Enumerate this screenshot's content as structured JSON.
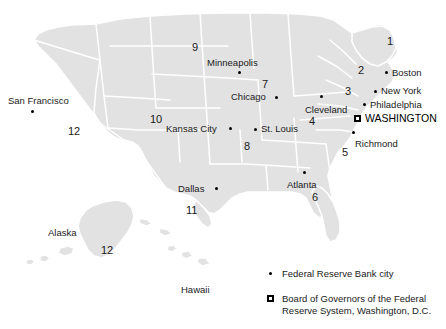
{
  "map": {
    "title": "Federal Reserve Districts Map",
    "land_color": "#e2e2e2",
    "border_color": "#ffffff",
    "background_color": "#ffffff",
    "marker_color": "#000000"
  },
  "cities": [
    {
      "name": "San Francisco",
      "label_x": 8,
      "label_y": 96,
      "dot_x": 31,
      "dot_y": 110
    },
    {
      "name": "Minneapolis",
      "label_x": 207,
      "label_y": 58,
      "dot_x": 238,
      "dot_y": 71
    },
    {
      "name": "Chicago",
      "label_x": 231,
      "label_y": 92,
      "dot_x": 275,
      "dot_y": 96
    },
    {
      "name": "Kansas City",
      "label_x": 166,
      "label_y": 124,
      "dot_x": 229,
      "dot_y": 127
    },
    {
      "name": "St. Louis",
      "label_x": 261,
      "label_y": 124,
      "dot_x": 255,
      "dot_y": 128
    },
    {
      "name": "Cleveland",
      "label_x": 305,
      "label_y": 105,
      "dot_x": 320,
      "dot_y": 95
    },
    {
      "name": "Boston",
      "label_x": 392,
      "label_y": 68,
      "dot_x": 385,
      "dot_y": 71
    },
    {
      "name": "New York",
      "label_x": 381,
      "label_y": 86,
      "dot_x": 374,
      "dot_y": 90
    },
    {
      "name": "Philadelphia",
      "label_x": 370,
      "label_y": 100,
      "dot_x": 363,
      "dot_y": 103
    },
    {
      "name": "Richmond",
      "label_x": 355,
      "label_y": 139,
      "dot_x": 352,
      "dot_y": 131
    },
    {
      "name": "Atlanta",
      "label_x": 287,
      "label_y": 180,
      "dot_x": 303,
      "dot_y": 171
    },
    {
      "name": "Dallas",
      "label_x": 178,
      "label_y": 184,
      "dot_x": 215,
      "dot_y": 187
    }
  ],
  "districts": [
    {
      "number": "1",
      "x": 387,
      "y": 36
    },
    {
      "number": "2",
      "x": 358,
      "y": 65
    },
    {
      "number": "3",
      "x": 345,
      "y": 86
    },
    {
      "number": "4",
      "x": 309,
      "y": 116
    },
    {
      "number": "5",
      "x": 342,
      "y": 147
    },
    {
      "number": "6",
      "x": 312,
      "y": 192
    },
    {
      "number": "7",
      "x": 262,
      "y": 79
    },
    {
      "number": "8",
      "x": 244,
      "y": 141
    },
    {
      "number": "9",
      "x": 192,
      "y": 42
    },
    {
      "number": "10",
      "x": 150,
      "y": 114
    },
    {
      "number": "11",
      "x": 186,
      "y": 205
    },
    {
      "number": "12",
      "x": 68,
      "y": 126
    }
  ],
  "insets": [
    {
      "name": "Alaska",
      "label_x": 48,
      "label_y": 228,
      "number": "12",
      "number_x": 101,
      "number_y": 245
    },
    {
      "name": "Hawaii",
      "label_x": 181,
      "label_y": 285,
      "number": "",
      "number_x": 0,
      "number_y": 0
    }
  ],
  "capital": {
    "name": "WASHINGTON",
    "marker_x": 354,
    "marker_y": 115,
    "label_x": 365,
    "label_y": 113
  },
  "legend": {
    "items": [
      {
        "marker": "dot",
        "text": "Federal Reserve Bank city"
      },
      {
        "marker": "square",
        "text_line1": "Board of Governors of the Federal",
        "text_line2": "Reserve System, Washington, D.C."
      }
    ]
  }
}
